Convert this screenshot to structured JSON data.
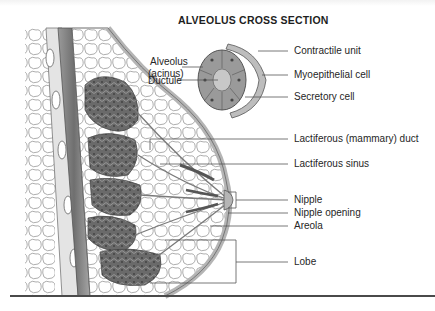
{
  "figure": {
    "inset_title": "ALVEOLUS CROSS SECTION",
    "inset_labels": {
      "alveolus_line1": "Alveolus",
      "alveolus_line2": "(acinus)",
      "ductule": "Ductule",
      "contractile_unit": "Contractile unit",
      "myoepithelial_cell": "Myoepithelial cell",
      "secretory_cell": "Secretory cell"
    },
    "main_labels": {
      "lactiferous_duct": "Lactiferous (mammary) duct",
      "lactiferous_sinus": "Lactiferous sinus",
      "nipple": "Nipple",
      "nipple_opening": "Nipple opening",
      "areola": "Areola",
      "lobe": "Lobe"
    },
    "colors": {
      "line": "#555555",
      "tissue_dark": "#6e6e6e",
      "tissue_mid": "#a8a8a8",
      "tissue_light": "#d6d6d6",
      "rule": "#4a4a4a"
    }
  }
}
